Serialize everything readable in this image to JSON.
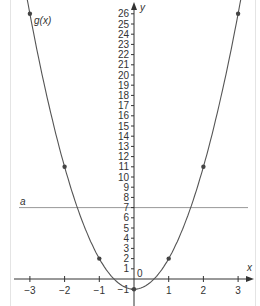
{
  "chart_data": {
    "type": "line",
    "title": "",
    "function_label": "g(x)",
    "function_expression": "3x^2 - 1",
    "xlabel": "x",
    "ylabel": "y",
    "origin_label": "0",
    "xlim": [
      -3.3,
      3.3
    ],
    "ylim": [
      -2,
      27
    ],
    "x_ticks": [
      -3,
      -2,
      -1,
      1,
      2,
      3
    ],
    "x_tick_labels": [
      "−3",
      "−2",
      "−1",
      "1",
      "2",
      "3"
    ],
    "y_ticks": [
      -1,
      1,
      2,
      3,
      4,
      5,
      6,
      7,
      8,
      9,
      10,
      11,
      12,
      13,
      14,
      15,
      16,
      17,
      18,
      19,
      20,
      21,
      22,
      23,
      24,
      25,
      26
    ],
    "y_tick_labels": [
      "−1",
      "1",
      "2",
      "3",
      "4",
      "5",
      "6",
      "7",
      "8",
      "9",
      "10",
      "11",
      "12",
      "13",
      "14",
      "15",
      "16",
      "17",
      "18",
      "19",
      "20",
      "21",
      "22",
      "23",
      "24",
      "25",
      "26"
    ],
    "series": [
      {
        "name": "g(x)",
        "points": [
          {
            "x": -3,
            "y": 26
          },
          {
            "x": -2,
            "y": 11
          },
          {
            "x": -1,
            "y": 2
          },
          {
            "x": 0,
            "y": -1
          },
          {
            "x": 1,
            "y": 2
          },
          {
            "x": 2,
            "y": 11
          },
          {
            "x": 3,
            "y": 26
          }
        ]
      }
    ],
    "horizontal_lines": [
      {
        "name": "a",
        "y": 7
      }
    ],
    "grid": false,
    "legend": "none"
  },
  "colors": {
    "curve": "#555555",
    "axis": "#333333",
    "line_a": "#999999",
    "points": "#444444"
  }
}
